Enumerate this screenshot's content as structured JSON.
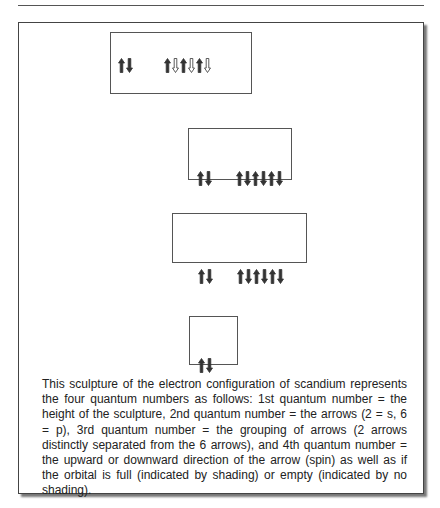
{
  "figure": {
    "boxes": [
      {
        "id": "box-1",
        "arrow_groups": [
          [
            "up-filled",
            "down-filled"
          ],
          [
            "up-filled",
            "down-empty",
            "up-filled",
            "down-empty",
            "up-filled",
            "down-empty"
          ]
        ]
      },
      {
        "id": "box-2",
        "arrow_groups": [
          [
            "up-filled",
            "down-filled"
          ],
          [
            "up-filled",
            "down-filled",
            "up-filled",
            "down-filled",
            "up-filled",
            "down-filled"
          ]
        ]
      },
      {
        "id": "box-3",
        "arrow_groups": [
          [
            "up-filled",
            "down-filled"
          ],
          [
            "up-filled",
            "down-filled",
            "up-filled",
            "down-filled",
            "up-filled",
            "down-filled"
          ]
        ]
      },
      {
        "id": "box-4",
        "arrow_groups": [
          [
            "up-filled",
            "down-filled"
          ]
        ]
      }
    ],
    "colors": {
      "arrow_fill": "#333333",
      "arrow_empty": "#ffffff",
      "border": "#555555"
    }
  },
  "caption": {
    "text": "This sculpture of the electron configuration of scandium represents the four quantum numbers as follows: 1st quantum number = the height of the sculpture, 2nd quantum number = the arrows (2 = s, 6 = p), 3rd quantum number = the grouping of arrows (2 arrows distinctly separated from the 6 arrows), and 4th quantum number = the upward or downward direction of the arrow (spin) as well as if the orbital is full (indicated by shading) or empty (indicated by no shading)."
  }
}
